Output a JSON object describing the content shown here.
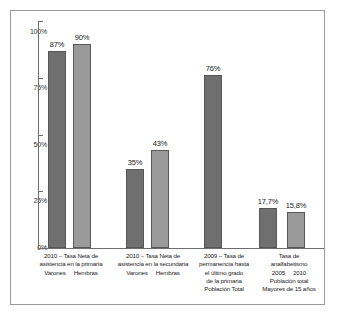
{
  "chart_data": {
    "type": "bar",
    "title": "",
    "xlabel": "",
    "ylabel": "",
    "ylim": [
      0,
      100
    ],
    "grid": false,
    "legend": "none",
    "y_ticks": [
      "0%",
      "25%",
      "50%",
      "75%",
      "100%"
    ],
    "y_tick_values": [
      0,
      25,
      50,
      75,
      100
    ],
    "categories": [
      "2010 – Tasa Neta de asistencia en la primaria — Varones",
      "2010 – Tasa Neta de asistencia en la primaria — Hembras",
      "2010 – Tasa Neta de asistencia en la secundaria — Varones",
      "2010 – Tasa Neta de asistencia en la secundaria — Hembras",
      "2009 – Tasa de permanencia hasta el último grado de la primaria — Población Total",
      "Tasa de analfabetismo — 2005",
      "Tasa de analfabetismo — 2010"
    ],
    "values": [
      87,
      90,
      35,
      43,
      76,
      17.7,
      15.8
    ],
    "value_labels": [
      "87%",
      "90%",
      "35%",
      "43%",
      "76%",
      "17,7%",
      "15,8%"
    ],
    "bars": [
      {
        "label": "87%",
        "value": 87,
        "shade": "dark",
        "group": 0
      },
      {
        "label": "90%",
        "value": 90,
        "shade": "light",
        "group": 0
      },
      {
        "label": "35%",
        "value": 35,
        "shade": "dark",
        "group": 1
      },
      {
        "label": "43%",
        "value": 43,
        "shade": "light",
        "group": 1
      },
      {
        "label": "76%",
        "value": 76,
        "shade": "dark",
        "group": 2
      },
      {
        "label": "17,7%",
        "value": 17.7,
        "shade": "dark",
        "group": 3
      },
      {
        "label": "15,8%",
        "value": 15.8,
        "shade": "light",
        "group": 3
      }
    ],
    "groups": [
      {
        "title_lines": [
          "2010 – Tasa Neta de",
          "asistencia en la primaria"
        ],
        "sub_labels": [
          "Varones",
          "Hembras"
        ],
        "footer_lines": []
      },
      {
        "title_lines": [
          "2010 – Tasa Neta de",
          "asistencia en la secundaria"
        ],
        "sub_labels": [
          "Varones",
          "Hembras"
        ],
        "footer_lines": []
      },
      {
        "title_lines": [
          "2009 – Tasa de",
          "permanencia hasta",
          "el último grado",
          "de la primaria",
          "Población Total"
        ],
        "sub_labels": [],
        "footer_lines": []
      },
      {
        "title_lines": [
          "Tasa de",
          "analfabetismo"
        ],
        "sub_labels": [
          "2005",
          "2010"
        ],
        "footer_lines": [
          "Población total",
          "Mayores de 15 años"
        ]
      }
    ],
    "colors": {
      "bar_dark": "#6f6f6f",
      "bar_light": "#9a9a9a",
      "bar_border": "#575757",
      "axis": "#6d6d6d",
      "frame": "#9a9a9a",
      "background": "#ffffff",
      "text": "#1c1c1c"
    }
  }
}
